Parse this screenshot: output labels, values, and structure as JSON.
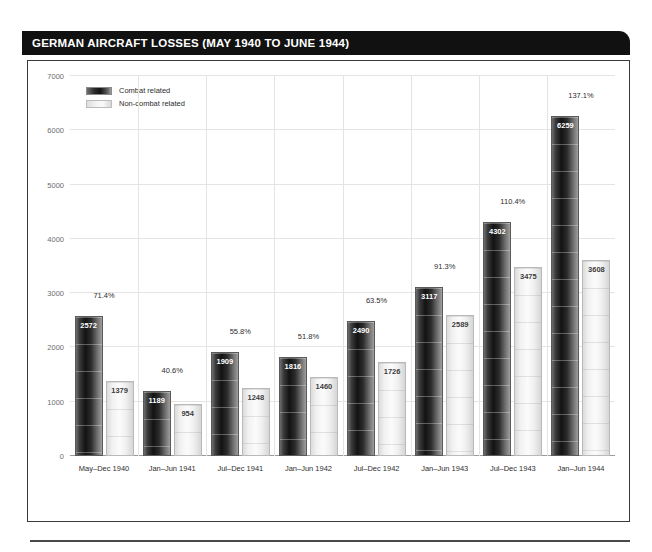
{
  "header": {
    "title": "GERMAN AIRCRAFT LOSSES (MAY 1940 TO JUNE 1944)"
  },
  "legend": {
    "items": [
      {
        "label": "Combat related",
        "key": "combat",
        "color": "#131313"
      },
      {
        "label": "Non-combat related",
        "key": "noncombat",
        "color": "#f2f2f2"
      }
    ]
  },
  "chart_data": {
    "type": "bar",
    "title": "GERMAN AIRCRAFT LOSSES (MAY 1940 TO JUNE 1944)",
    "xlabel": "",
    "ylabel": "",
    "ylim": [
      0,
      7000
    ],
    "yticks": [
      0,
      1000,
      2000,
      3000,
      4000,
      5000,
      6000,
      7000
    ],
    "ytick_labels": [
      "0",
      "1000",
      "2000",
      "3000",
      "4000",
      "5000",
      "6000",
      "7000"
    ],
    "grid": true,
    "legend_position": "top-left",
    "categories": [
      "May–Dec 1940",
      "Jan–Jun 1941",
      "Jul–Dec 1941",
      "Jan–Jun 1942",
      "Jul–Dec 1942",
      "Jan–Jun 1943",
      "Jul–Dec 1943",
      "Jan–Jun 1944"
    ],
    "series": [
      {
        "name": "Combat related",
        "values": [
          2572,
          1189,
          1909,
          1816,
          2490,
          3117,
          4302,
          6259
        ]
      },
      {
        "name": "Non-combat related",
        "values": [
          1379,
          954,
          1248,
          1460,
          1726,
          2589,
          3475,
          3608
        ]
      }
    ],
    "annotations": {
      "name": "percent labels",
      "values": [
        "71.4%",
        "40.6%",
        "55.8%",
        "51.8%",
        "63.5%",
        "91.3%",
        "110.4%",
        "137.1%"
      ]
    }
  }
}
